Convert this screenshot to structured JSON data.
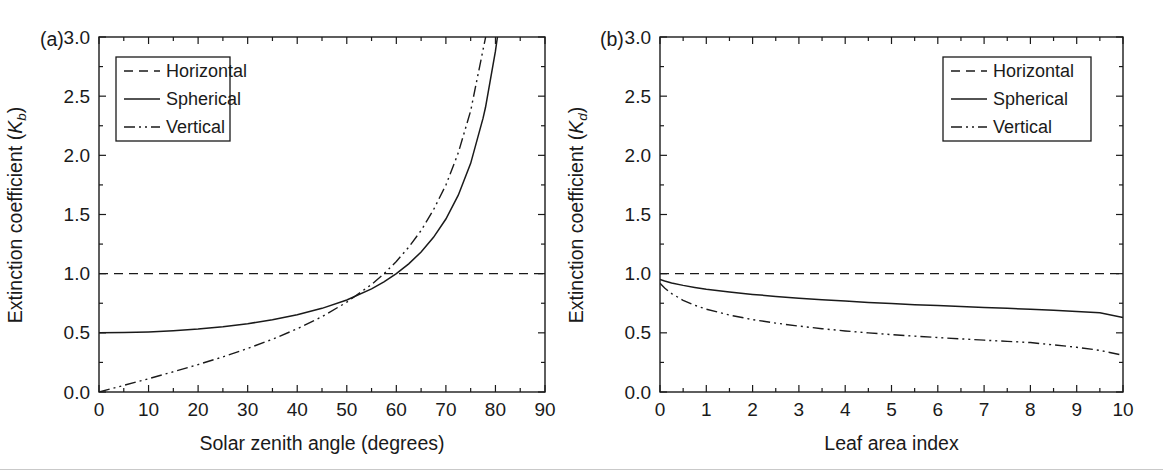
{
  "figure": {
    "background_color": "#ffffff",
    "line_color": "#1a1a1a",
    "panels": [
      {
        "id": "a",
        "panel_label": "(a)",
        "xlabel": "Solar zenith angle (degrees)",
        "ylabel_main": "Extinction coefficient (",
        "ylabel_symbol": "K",
        "ylabel_subscript": "b",
        "ylabel_close": ")",
        "xticks": [
          "0",
          "10",
          "20",
          "30",
          "40",
          "50",
          "60",
          "70",
          "80",
          "90"
        ],
        "yticks": [
          "0.0",
          "0.5",
          "1.0",
          "1.5",
          "2.0",
          "2.5",
          "3.0"
        ],
        "legend": {
          "position": "upper-left",
          "entries": [
            {
              "label": "Horizontal",
              "style": "dashed"
            },
            {
              "label": "Spherical",
              "style": "solid"
            },
            {
              "label": "Vertical",
              "style": "dashdot"
            }
          ]
        }
      },
      {
        "id": "b",
        "panel_label": "(b)",
        "xlabel": "Leaf area index",
        "ylabel_main": "Extinction coefficient (",
        "ylabel_symbol": "K",
        "ylabel_subscript": "d",
        "ylabel_close": ")",
        "xticks": [
          "0",
          "1",
          "2",
          "3",
          "4",
          "5",
          "6",
          "7",
          "8",
          "9",
          "10"
        ],
        "yticks": [
          "0.0",
          "0.5",
          "1.0",
          "1.5",
          "2.0",
          "2.5",
          "3.0"
        ],
        "legend": {
          "position": "upper-right",
          "entries": [
            {
              "label": "Horizontal",
              "style": "dashed"
            },
            {
              "label": "Spherical",
              "style": "solid"
            },
            {
              "label": "Vertical",
              "style": "dashdot"
            }
          ]
        }
      }
    ]
  },
  "chart_data": [
    {
      "type": "line",
      "panel": "(a)",
      "title": "",
      "xlabel": "Solar zenith angle (degrees)",
      "ylabel": "Extinction coefficient (Kb)",
      "xlim": [
        0,
        90
      ],
      "ylim": [
        0,
        3.0
      ],
      "xticks": [
        0,
        10,
        20,
        30,
        40,
        50,
        60,
        70,
        80,
        90
      ],
      "yticks": [
        0.0,
        0.5,
        1.0,
        1.5,
        2.0,
        2.5,
        3.0
      ],
      "grid": false,
      "legend_position": "upper left",
      "x": [
        0,
        5,
        10,
        15,
        20,
        25,
        30,
        35,
        40,
        45,
        50,
        55,
        57.5,
        60,
        62.5,
        65,
        67.5,
        70,
        72.5,
        75,
        77.5,
        78,
        80,
        80.4,
        82.5,
        85,
        90
      ],
      "series": [
        {
          "name": "Horizontal",
          "style": "dashed",
          "formula": "Kb = 1",
          "values": [
            1.0,
            1.0,
            1.0,
            1.0,
            1.0,
            1.0,
            1.0,
            1.0,
            1.0,
            1.0,
            1.0,
            1.0,
            1.0,
            1.0,
            1.0,
            1.0,
            1.0,
            1.0,
            1.0,
            1.0,
            1.0,
            1.0,
            1.0,
            1.0,
            1.0,
            1.0,
            1.0
          ]
        },
        {
          "name": "Spherical",
          "style": "solid",
          "formula": "Kb = 0.5 / cos(theta)",
          "values": [
            0.5,
            0.502,
            0.508,
            0.518,
            0.532,
            0.552,
            0.577,
            0.611,
            0.653,
            0.707,
            0.778,
            0.872,
            0.931,
            1.0,
            1.083,
            1.183,
            1.307,
            1.462,
            1.663,
            1.932,
            2.314,
            2.406,
            2.88,
            3.0,
            3.81,
            5.74,
            null
          ]
        },
        {
          "name": "Vertical",
          "style": "dashdot",
          "formula": "Kb = (2/pi) * tan(theta)",
          "values": [
            0.0,
            0.056,
            0.112,
            0.171,
            0.232,
            0.297,
            0.368,
            0.446,
            0.534,
            0.637,
            0.759,
            0.909,
            0.999,
            1.103,
            1.224,
            1.365,
            1.54,
            1.749,
            2.021,
            2.376,
            2.893,
            2.995,
            3.61,
            3.75,
            4.85,
            7.28,
            null
          ]
        }
      ]
    },
    {
      "type": "line",
      "panel": "(b)",
      "title": "",
      "xlabel": "Leaf area index",
      "ylabel": "Extinction coefficient (Kd)",
      "xlim": [
        0,
        10
      ],
      "ylim": [
        0,
        3.0
      ],
      "xticks": [
        0,
        1,
        2,
        3,
        4,
        5,
        6,
        7,
        8,
        9,
        10
      ],
      "yticks": [
        0.0,
        0.5,
        1.0,
        1.5,
        2.0,
        2.5,
        3.0
      ],
      "grid": false,
      "legend_position": "upper right",
      "x": [
        0,
        0.1,
        0.25,
        0.5,
        0.75,
        1,
        1.5,
        2,
        2.5,
        3,
        3.5,
        4,
        4.5,
        5,
        5.5,
        6,
        6.5,
        7,
        7.5,
        8,
        8.5,
        9,
        9.5,
        10
      ],
      "series": [
        {
          "name": "Horizontal",
          "style": "dashed",
          "formula": "Kd = 1",
          "values": [
            1.0,
            1.0,
            1.0,
            1.0,
            1.0,
            1.0,
            1.0,
            1.0,
            1.0,
            1.0,
            1.0,
            1.0,
            1.0,
            1.0,
            1.0,
            1.0,
            1.0,
            1.0,
            1.0,
            1.0,
            1.0,
            1.0,
            1.0,
            1.0
          ]
        },
        {
          "name": "Spherical",
          "style": "solid",
          "values": [
            0.95,
            0.938,
            0.922,
            0.901,
            0.884,
            0.869,
            0.845,
            0.825,
            0.808,
            0.793,
            0.78,
            0.768,
            0.757,
            0.747,
            0.738,
            0.73,
            0.722,
            0.714,
            0.707,
            0.7,
            0.69,
            0.68,
            0.67,
            0.63
          ]
        },
        {
          "name": "Vertical",
          "style": "dashdot",
          "values": [
            0.92,
            0.878,
            0.832,
            0.775,
            0.733,
            0.7,
            0.65,
            0.612,
            0.582,
            0.557,
            0.535,
            0.516,
            0.5,
            0.485,
            0.472,
            0.46,
            0.449,
            0.438,
            0.428,
            0.418,
            0.398,
            0.378,
            0.352,
            0.31
          ]
        }
      ]
    }
  ]
}
